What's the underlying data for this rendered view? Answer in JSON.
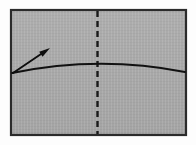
{
  "figure": {
    "kind": "instructional-fold-step",
    "canvas": {
      "width": 196,
      "height": 145,
      "background": "#fdfdfd"
    },
    "paper_sheet": {
      "name": "paper-sheet",
      "shape": "rectangle",
      "x": 11,
      "y": 10,
      "width": 175,
      "height": 125,
      "fill": "#a9a9a9",
      "stroke": "#2b2b2b",
      "stroke_width": 2.2
    },
    "crease_line": {
      "name": "vertical-dashed-crease-line",
      "style": "dashed",
      "orientation": "vertical",
      "x": 97.5,
      "y_start": 11,
      "y_end": 134,
      "color": "#1a1a1a",
      "stroke_width": 2.4,
      "dash_length": 6,
      "dash_gap": 4
    },
    "fold_curve": {
      "name": "curved-fold-edge",
      "style": "solid-arc",
      "color": "#111111",
      "stroke_width": 1.9,
      "start": {
        "x": 12,
        "y": 73
      },
      "control": {
        "x": 99,
        "y": 55
      },
      "end": {
        "x": 185,
        "y": 72
      }
    },
    "fold_arrow": {
      "name": "fold-direction-arrow",
      "color": "#0d0d0d",
      "stroke_width": 1.9,
      "tail": {
        "x": 13,
        "y": 73
      },
      "tip": {
        "x": 50,
        "y": 48
      },
      "head_length": 11,
      "head_width": 6,
      "direction": "up-right"
    },
    "texture": {
      "name": "scan-grain-overlay",
      "opacity": 0.07,
      "color": "#ffffff"
    }
  }
}
